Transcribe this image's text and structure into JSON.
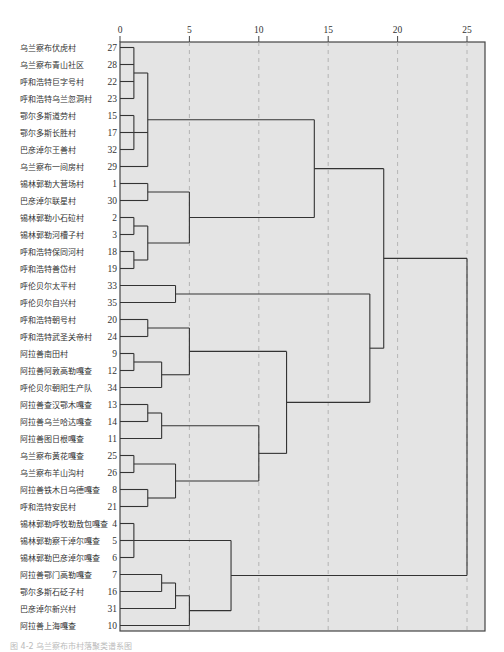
{
  "caption": "图 4-2  乌兰察布市村落聚类谱系图",
  "chart_data": {
    "type": "dendrogram",
    "title": "",
    "xlabel": "",
    "ylabel": "",
    "x_ticks": [
      0,
      5,
      10,
      15,
      20,
      25
    ],
    "xlim": [
      0,
      26.5
    ],
    "grid": "vertical dashed at ticks",
    "leaves": [
      {
        "name": "乌兰察布伏虎村",
        "id": 27
      },
      {
        "name": "乌兰察布青山社区",
        "id": 28
      },
      {
        "name": "呼和浩特巨字号村",
        "id": 22
      },
      {
        "name": "呼和浩特乌兰忽洞村",
        "id": 23
      },
      {
        "name": "鄂尔多斯道劳村",
        "id": 15
      },
      {
        "name": "鄂尔多斯长胜村",
        "id": 17
      },
      {
        "name": "巴彦淖尔王善村",
        "id": 32
      },
      {
        "name": "乌兰察布一间房村",
        "id": 29
      },
      {
        "name": "锡林郭勒大营场村",
        "id": 1
      },
      {
        "name": "巴彦淖尔联星村",
        "id": 30
      },
      {
        "name": "锡林郭勒小石砬村",
        "id": 2
      },
      {
        "name": "锡林郭勒河槽子村",
        "id": 3
      },
      {
        "name": "呼和浩特保同河村",
        "id": 18
      },
      {
        "name": "呼和浩特善岱村",
        "id": 19
      },
      {
        "name": "呼伦贝尔太平村",
        "id": 33
      },
      {
        "name": "呼伦贝尔自兴村",
        "id": 35
      },
      {
        "name": "呼和浩特朝号村",
        "id": 20
      },
      {
        "name": "呼和浩特武圣关帝村",
        "id": 24
      },
      {
        "name": "阿拉善南田村",
        "id": 9
      },
      {
        "name": "阿拉善阿敦高勒嘎查",
        "id": 12
      },
      {
        "name": "呼伦贝尔朝阳生产队",
        "id": 34
      },
      {
        "name": "阿拉善查汉鄂木嘎查",
        "id": 13
      },
      {
        "name": "阿拉善乌兰哈达嘎查",
        "id": 14
      },
      {
        "name": "阿拉善图日根嘎查",
        "id": 11
      },
      {
        "name": "乌兰察布黄花嘎查",
        "id": 25
      },
      {
        "name": "乌兰察布羊山沟村",
        "id": 26
      },
      {
        "name": "阿拉善铁木日乌德嘎查",
        "id": 8
      },
      {
        "name": "呼和浩特安民村",
        "id": 21
      },
      {
        "name": "锡林郭勒呼牧勒敖包嘎查",
        "id": 4
      },
      {
        "name": "锡林郭勒察干淖尔嘎查",
        "id": 5
      },
      {
        "name": "锡林郭勒巴彦淖尔嘎查",
        "id": 6
      },
      {
        "name": "阿拉善鄂门高勒嘎查",
        "id": 7
      },
      {
        "name": "鄂尔多斯石砭子村",
        "id": 16
      },
      {
        "name": "巴彦淖尔新兴村",
        "id": 31
      },
      {
        "name": "阿拉善上海嘎查",
        "id": 10
      }
    ],
    "merges": [
      {
        "rows": [
          0,
          3
        ],
        "height": 1,
        "comment": "27,28,22,23"
      },
      {
        "rows": [
          4,
          6
        ],
        "height": 1,
        "comment": "15,17,32"
      },
      {
        "join": [
          [
            0,
            3
          ],
          [
            4,
            6
          ],
          [
            7,
            7
          ]
        ],
        "height": 2,
        "comment": "+29"
      },
      {
        "rows": [
          8,
          9
        ],
        "height": 2,
        "comment": "1,30"
      },
      {
        "rows": [
          10,
          11
        ],
        "height": 1,
        "comment": "2,3"
      },
      {
        "rows": [
          12,
          13
        ],
        "height": 1,
        "comment": "18,19"
      },
      {
        "join": [
          [
            10,
            11
          ],
          [
            12,
            13
          ]
        ],
        "height": 2
      },
      {
        "join": [
          [
            8,
            9
          ],
          [
            10,
            13
          ]
        ],
        "height": 5
      },
      {
        "join": [
          [
            0,
            7
          ],
          [
            8,
            13
          ]
        ],
        "height": 14
      },
      {
        "rows": [
          14,
          15
        ],
        "height": 4,
        "comment": "33,35"
      },
      {
        "rows": [
          16,
          17
        ],
        "height": 2,
        "comment": "20,24"
      },
      {
        "rows": [
          18,
          19
        ],
        "height": 1,
        "comment": "9,12"
      },
      {
        "join": [
          [
            18,
            19
          ],
          [
            20,
            20
          ]
        ],
        "height": 3,
        "comment": "+34"
      },
      {
        "join": [
          [
            16,
            17
          ],
          [
            18,
            20
          ]
        ],
        "height": 5
      },
      {
        "rows": [
          21,
          22
        ],
        "height": 2,
        "comment": "13,14"
      },
      {
        "join": [
          [
            21,
            22
          ],
          [
            23,
            23
          ]
        ],
        "height": 3,
        "comment": "+11"
      },
      {
        "rows": [
          24,
          25
        ],
        "height": 1,
        "comment": "25,26"
      },
      {
        "rows": [
          26,
          27
        ],
        "height": 2,
        "comment": "8,21"
      },
      {
        "join": [
          [
            24,
            25
          ],
          [
            26,
            27
          ]
        ],
        "height": 4
      },
      {
        "join": [
          [
            21,
            23
          ],
          [
            24,
            27
          ]
        ],
        "height": 10
      },
      {
        "join": [
          [
            16,
            20
          ],
          [
            21,
            27
          ]
        ],
        "height": 12
      },
      {
        "join": [
          [
            14,
            15
          ],
          [
            16,
            27
          ]
        ],
        "height": 18
      },
      {
        "join": [
          [
            0,
            13
          ],
          [
            14,
            27
          ]
        ],
        "height": 19
      },
      {
        "rows": [
          28,
          30
        ],
        "height": 1,
        "comment": "4,5,6"
      },
      {
        "rows": [
          31,
          32
        ],
        "height": 3,
        "comment": "7,16"
      },
      {
        "join": [
          [
            31,
            32
          ],
          [
            33,
            33
          ]
        ],
        "height": 4,
        "comment": "+31"
      },
      {
        "join": [
          [
            31,
            33
          ],
          [
            34,
            34
          ]
        ],
        "height": 5,
        "comment": "+10"
      },
      {
        "join": [
          [
            28,
            30
          ],
          [
            31,
            34
          ]
        ],
        "height": 8
      },
      {
        "join": [
          [
            0,
            27
          ],
          [
            28,
            34
          ]
        ],
        "height": 25
      }
    ]
  }
}
